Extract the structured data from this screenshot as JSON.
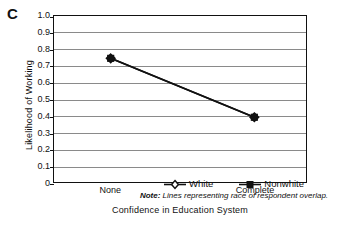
{
  "panel": {
    "letter": "C"
  },
  "note": {
    "lead": "Note:",
    "text": " Lines representing race of respondent overlap.",
    "full": "Note: Lines representing race of respondent overlap."
  },
  "chart_data": {
    "type": "line",
    "title": "",
    "xlabel": "Confidence in Education System",
    "ylabel": "Likelihood of Working",
    "categories": [
      "None",
      "Complete"
    ],
    "ylim": [
      0,
      1.0
    ],
    "ytick_values": [
      0,
      0.1,
      0.2,
      0.3,
      0.4,
      0.5,
      0.6,
      0.7,
      0.8,
      0.9,
      1.0
    ],
    "ytick_labels": [
      "0",
      "0.1",
      "0.2",
      "0.3",
      "0.4",
      "0.5",
      "0.6",
      "0.7",
      "0.8",
      "0.9",
      "1.0"
    ],
    "grid": true,
    "legend_position": "inside-bottom-center",
    "series": [
      {
        "name": "White",
        "marker": "open-diamond",
        "color": "#111111",
        "values": [
          0.745,
          0.39
        ]
      },
      {
        "name": "Nonwhite",
        "marker": "filled-square",
        "color": "#111111",
        "values": [
          0.745,
          0.39
        ]
      }
    ],
    "annotations": [
      "Note: Lines representing race of respondent overlap."
    ],
    "colors": {
      "frame": "#111111",
      "gridline": "#8a8a8a",
      "series": "#111111",
      "background": "#ffffff"
    }
  }
}
